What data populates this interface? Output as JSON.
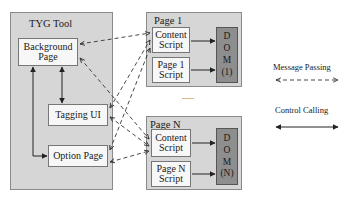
{
  "tyg_tool": {
    "title": "TYG Tool",
    "background_page": "Background Page",
    "tagging_ui": "Tagging UI",
    "option_page": "Option Page"
  },
  "page1": {
    "title": "Page 1",
    "content_script": "Content Script",
    "page_script": "Page 1 Script",
    "dom_letters": [
      "D",
      "O",
      "M",
      "(1)"
    ]
  },
  "ellipsis": "......",
  "pageN": {
    "title": "Page N",
    "content_script": "Content Script",
    "page_script": "Page N Script",
    "dom_letters": [
      "D",
      "O",
      "M",
      "(N)"
    ]
  },
  "legend": {
    "message_passing": "Message Passing",
    "control_calling": "Control Calling"
  },
  "colors": {
    "group_fill": "#d6d6d6",
    "box_fill": "#f7f7f7",
    "dom_fill": "#8e8e8e",
    "stroke": "#333333"
  }
}
